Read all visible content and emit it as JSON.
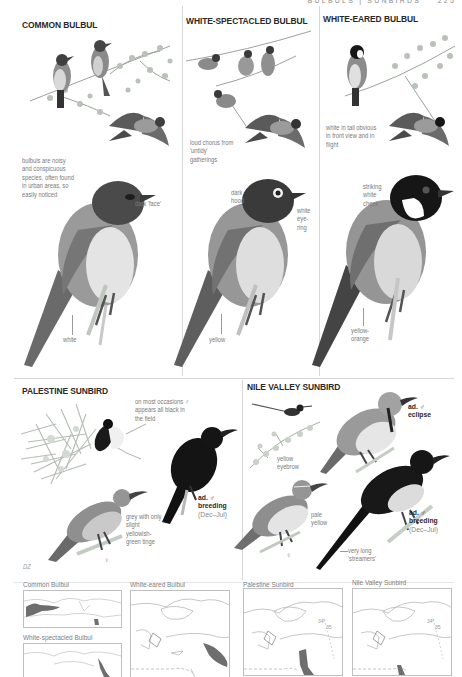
{
  "page": {
    "running_head": "BULBULS | SUNBIRDS",
    "page_number": "225",
    "artist_initials": "DZ"
  },
  "species": [
    {
      "id": "common-bulbul",
      "title": "COMMON BULBUL",
      "notes": {
        "general": "bulbuls are noisy and conspicuous species, often found in urban areas, so easily noticed",
        "head": "dark 'face'",
        "vent": "white"
      },
      "colors": {
        "head": "#3f3f3f",
        "body": "#8e8e8e",
        "belly": "#e6e6e6",
        "vent": "#f4f4f4"
      }
    },
    {
      "id": "white-spectacled-bulbul",
      "title": "WHITE-SPECTACLED BULBUL",
      "notes": {
        "general": "loud chorus from 'untidy' gatherings",
        "head": "dark hood",
        "eye": "white eye-ring",
        "vent": "yellow"
      },
      "colors": {
        "head": "#3a3a3a",
        "body": "#8a8a8a",
        "belly": "#dedede",
        "vent": "#cfcfcf"
      }
    },
    {
      "id": "white-eared-bulbul",
      "title": "WHITE-EARED BULBUL",
      "notes": {
        "general": "white in tail obvious in front view and in flight",
        "cheek": "striking white cheek",
        "vent": "yellow-orange"
      },
      "colors": {
        "head": "#161616",
        "cheek": "#ffffff",
        "body": "#8c8c8c",
        "belly": "#d9d9d9",
        "vent": "#c8c8c8"
      }
    },
    {
      "id": "palestine-sunbird",
      "title": "PALESTINE SUNBIRD",
      "notes": {
        "general": "on most occasions ♂ appears all black in the field",
        "female": "grey with only slight yellowish-green tinge",
        "female_symbol": "♀",
        "male_label_age": "ad. ♂",
        "male_label_plumage": "breeding",
        "male_label_dates": "(Dec–Jul)"
      },
      "colors": {
        "male": "#141414",
        "female": "#8f8f8f",
        "female_belly": "#c9c9c9"
      }
    },
    {
      "id": "nile-valley-sunbird",
      "title": "NILE VALLEY SUNBIRD",
      "notes": {
        "eyebrow": "yellow eyebrow",
        "female_belly": "pale yellow",
        "female_symbol": "♀",
        "tail": "very long 'streamers'",
        "eclipse_label_age": "ad. ♂",
        "eclipse_label_plumage": "eclipse",
        "breeding_label_age": "ad. ♂",
        "breeding_label_plumage": "breeding",
        "breeding_label_dates": "(Dec–Jul)"
      },
      "colors": {
        "male": "#181818",
        "male_belly": "#dcdcdc",
        "female": "#8e8e8e",
        "female_belly": "#e4e4e4"
      }
    }
  ],
  "maps": [
    {
      "id": "map-common-bulbul",
      "label": "Common Bulbul",
      "range_color": "#6e6e6e"
    },
    {
      "id": "map-white-spectacled-bulbul",
      "label": "White-spectacled Bulbul",
      "range_color": "#6e6e6e"
    },
    {
      "id": "map-white-eared-bulbul",
      "label": "White-eared Bulbul",
      "range_color": "#6e6e6e"
    },
    {
      "id": "map-palestine-sunbird",
      "label": "Palestine Sunbird",
      "range_color": "#6e6e6e"
    },
    {
      "id": "map-nile-valley-sunbird",
      "label": "Nile Valley Sunbird",
      "range_color": "#6e6e6e"
    }
  ],
  "map_annotations": {
    "latitude_a": "34°",
    "latitude_b": "35"
  }
}
